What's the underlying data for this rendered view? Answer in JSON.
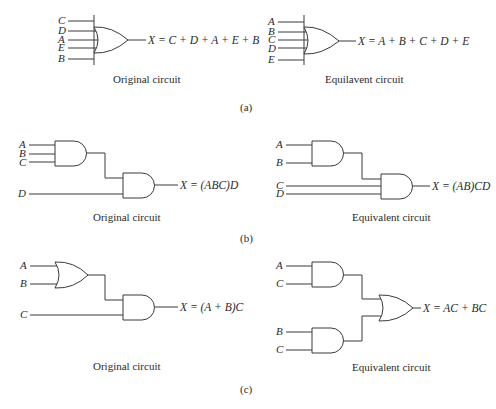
{
  "panels": {
    "a": {
      "label": "(a)",
      "original": {
        "caption": "Original circuit",
        "inputs": [
          "C",
          "D",
          "A",
          "E",
          "B"
        ],
        "gate": "OR",
        "equation": "X = C + D + A + E + B"
      },
      "equivalent": {
        "caption": "Equilavent circuit",
        "inputs": [
          "A",
          "B",
          "C",
          "D",
          "E"
        ],
        "gate": "OR",
        "equation": "X = A + B + C + D + E"
      }
    },
    "b": {
      "label": "(b)",
      "original": {
        "caption": "Original circuit",
        "gate1_inputs": [
          "A",
          "B",
          "C"
        ],
        "gate2_extra_input": "D",
        "gates": [
          "AND",
          "AND"
        ],
        "equation": "X = (ABC)D"
      },
      "equivalent": {
        "caption": "Equivalent circuit",
        "gate1_inputs": [
          "A",
          "B"
        ],
        "gate2_extra_inputs": [
          "C",
          "D"
        ],
        "gates": [
          "AND",
          "AND"
        ],
        "equation": "X = (AB)CD"
      }
    },
    "c": {
      "label": "(c)",
      "original": {
        "caption": "Original circuit",
        "gate1_inputs": [
          "A",
          "B"
        ],
        "gate2_extra_input": "C",
        "gates": [
          "OR",
          "AND"
        ],
        "equation": "X = (A + B)C"
      },
      "equivalent": {
        "caption": "Equivalent circuit",
        "gate1_inputs": [
          "A",
          "C"
        ],
        "gate2_inputs": [
          "B",
          "C"
        ],
        "gates": [
          "AND",
          "AND",
          "OR"
        ],
        "equation": "X = AC + BC"
      }
    }
  }
}
